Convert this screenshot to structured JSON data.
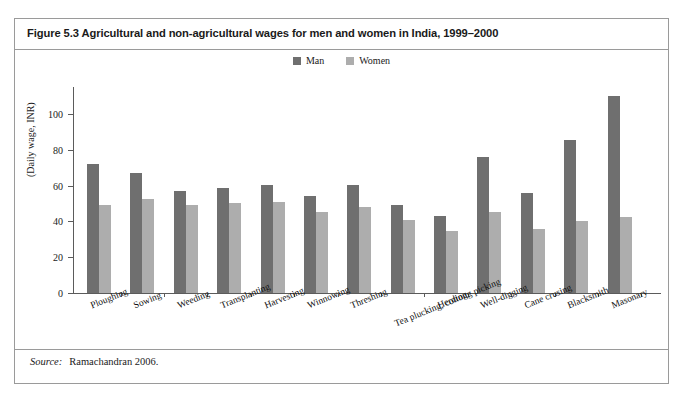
{
  "figure": {
    "title": "Figure 5.3 Agricultural and non-agricultural wages for men and women in India, 1999–2000",
    "source_label": "Source:",
    "source_text": "Ramachandran 2006."
  },
  "legend": {
    "position": "top-center",
    "items": [
      {
        "label": "Man",
        "color": "#6f6f6f"
      },
      {
        "label": "Women",
        "color": "#adadad"
      }
    ]
  },
  "axis": {
    "y_title": "(Daily wage, INR)",
    "y_ticks": [
      "0",
      "20",
      "40",
      "60",
      "80",
      "100"
    ]
  },
  "chart_data": {
    "type": "bar",
    "title": "Figure 5.3 Agricultural and non-agricultural wages for men and women in India, 1999–2000",
    "xlabel": "",
    "ylabel": "(Daily wage, INR)",
    "ylim": [
      0,
      115
    ],
    "ytick_values": [
      0,
      20,
      40,
      60,
      80,
      100
    ],
    "grid": false,
    "legend_position": "top-center",
    "categories": [
      "Ploughing",
      "Sowing",
      "Weeding",
      "Transplanting",
      "Harvesting",
      "Winnowing",
      "Threshing",
      "Tea plucking, cottong picking",
      "Herding",
      "Well-digging",
      "Cane crusing",
      "Blacksmith",
      "Masonary"
    ],
    "series": [
      {
        "name": "Man",
        "color": "#6f6f6f",
        "values": [
          72,
          67,
          57,
          58.5,
          60.5,
          54,
          60.5,
          49,
          43,
          76,
          56,
          85.5,
          110
        ]
      },
      {
        "name": "Women",
        "color": "#adadad",
        "values": [
          49,
          52.5,
          49,
          50.5,
          51,
          45.5,
          48,
          41,
          34.5,
          45,
          36,
          40,
          42.5
        ]
      }
    ]
  }
}
